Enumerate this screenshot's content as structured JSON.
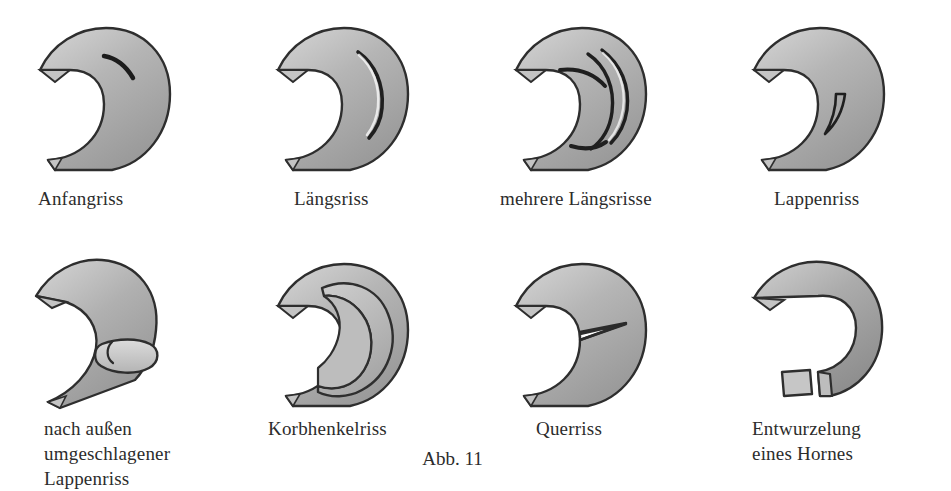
{
  "figure": {
    "number_label": "Abb. 11",
    "background_color": "#ffffff",
    "ink_color": "#2b2b2b",
    "tissue_fill": "#b9b9b9",
    "tissue_fill_light": "#d2d2d2",
    "tissue_shadow": "#8d8d8d"
  },
  "panels": [
    {
      "id": "anfangriss",
      "caption": "Anfangriss",
      "tear_kind": "incipient-tear",
      "row": "top",
      "column": 0
    },
    {
      "id": "laengsriss",
      "caption": "Längsriss",
      "tear_kind": "longitudinal-tear",
      "row": "top",
      "column": 1
    },
    {
      "id": "mehrere-laengsrisse",
      "caption": "mehrere Längsrisse",
      "tear_kind": "multiple-longitudinal-tears",
      "row": "top",
      "column": 2
    },
    {
      "id": "lappenriss",
      "caption": "Lappenriss",
      "tear_kind": "flap-tear",
      "row": "top",
      "column": 3
    },
    {
      "id": "umgeschlagener-lappenriss",
      "caption": "nach außen\numgeschlagener\nLappenriss",
      "tear_kind": "outward-folded-flap-tear",
      "row": "bottom",
      "column": 0
    },
    {
      "id": "korbhenkelriss",
      "caption": "Korbhenkelriss",
      "tear_kind": "bucket-handle-tear",
      "row": "bottom",
      "column": 1
    },
    {
      "id": "querriss",
      "caption": "Querriss",
      "tear_kind": "transverse-tear",
      "row": "bottom",
      "column": 2
    },
    {
      "id": "entwurzelung",
      "caption": "Entwurzelung\neines Hornes",
      "tear_kind": "horn-root-avulsion",
      "row": "bottom",
      "column": 3
    }
  ]
}
